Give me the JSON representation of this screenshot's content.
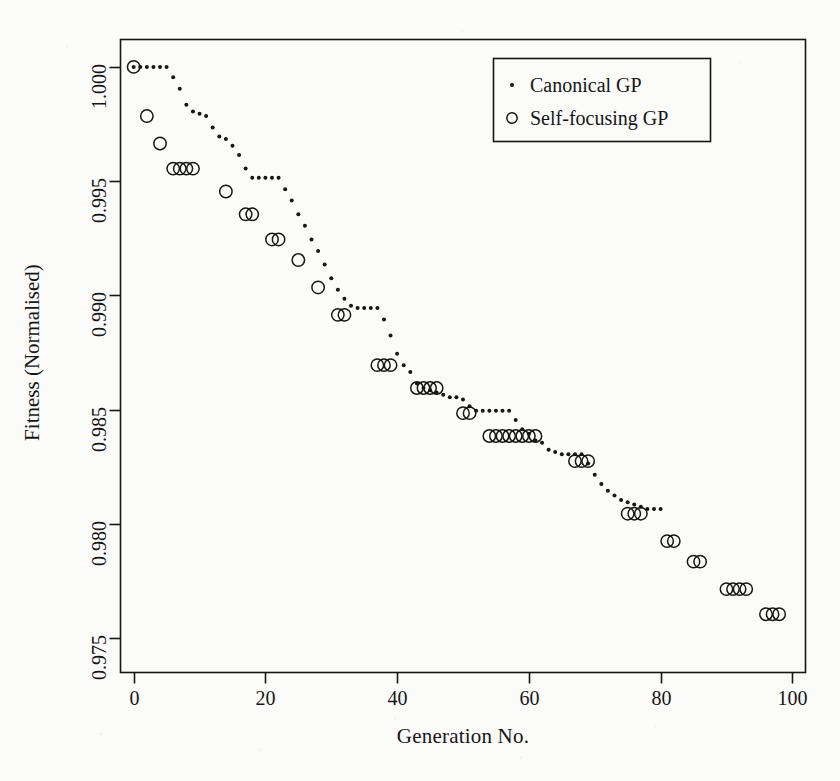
{
  "chart_data": {
    "type": "scatter",
    "title": "",
    "xlabel": "Generation No.",
    "ylabel": "Fitness (Normalised)",
    "xlim": [
      -2,
      102
    ],
    "ylim": [
      0.9735,
      1.0012
    ],
    "xticks": [
      0,
      20,
      40,
      60,
      80,
      100
    ],
    "xticklabels": [
      "0",
      "20",
      "40",
      "60",
      "80",
      "100"
    ],
    "yticks": [
      0.975,
      0.98,
      0.985,
      0.99,
      0.995,
      1.0
    ],
    "yticklabels": [
      "0.975",
      "0.980",
      "0.985",
      "0.990",
      "0.995",
      "1.000"
    ],
    "grid": false,
    "legend_position": "top-right",
    "series": [
      {
        "name": "Canonical GP",
        "marker": "dot",
        "points": [
          [
            0,
            1.0
          ],
          [
            1,
            1.0
          ],
          [
            2,
            1.0
          ],
          [
            3,
            1.0
          ],
          [
            4,
            1.0
          ],
          [
            5,
            1.0
          ],
          [
            6,
            0.99955
          ],
          [
            7,
            0.99905
          ],
          [
            8,
            0.99835
          ],
          [
            9,
            0.99805
          ],
          [
            10,
            0.99795
          ],
          [
            11,
            0.99785
          ],
          [
            12,
            0.99735
          ],
          [
            13,
            0.99695
          ],
          [
            14,
            0.99685
          ],
          [
            15,
            0.99655
          ],
          [
            16,
            0.99615
          ],
          [
            17,
            0.99555
          ],
          [
            18,
            0.99515
          ],
          [
            19,
            0.99515
          ],
          [
            20,
            0.99515
          ],
          [
            21,
            0.99515
          ],
          [
            22,
            0.99515
          ],
          [
            23,
            0.99465
          ],
          [
            24,
            0.99415
          ],
          [
            25,
            0.99355
          ],
          [
            26,
            0.99305
          ],
          [
            27,
            0.99245
          ],
          [
            28,
            0.99195
          ],
          [
            29,
            0.99135
          ],
          [
            30,
            0.99075
          ],
          [
            31,
            0.99025
          ],
          [
            32,
            0.98985
          ],
          [
            33,
            0.98955
          ],
          [
            34,
            0.98945
          ],
          [
            35,
            0.98945
          ],
          [
            36,
            0.98945
          ],
          [
            37,
            0.98945
          ],
          [
            38,
            0.98895
          ],
          [
            39,
            0.98825
          ],
          [
            40,
            0.98745
          ],
          [
            41,
            0.98695
          ],
          [
            42,
            0.98665
          ],
          [
            43,
            0.98615
          ],
          [
            44,
            0.98595
          ],
          [
            45,
            0.98585
          ],
          [
            46,
            0.98575
          ],
          [
            47,
            0.98565
          ],
          [
            48,
            0.98555
          ],
          [
            49,
            0.98555
          ],
          [
            50,
            0.98545
          ],
          [
            51,
            0.98515
          ],
          [
            52,
            0.98495
          ],
          [
            53,
            0.98495
          ],
          [
            54,
            0.98495
          ],
          [
            55,
            0.98495
          ],
          [
            56,
            0.98495
          ],
          [
            57,
            0.98495
          ],
          [
            58,
            0.98455
          ],
          [
            59,
            0.98415
          ],
          [
            60,
            0.98395
          ],
          [
            61,
            0.98365
          ],
          [
            62,
            0.98355
          ],
          [
            63,
            0.98325
          ],
          [
            64,
            0.98315
          ],
          [
            65,
            0.98305
          ],
          [
            66,
            0.98305
          ],
          [
            67,
            0.98305
          ],
          [
            68,
            0.98305
          ],
          [
            69,
            0.98265
          ],
          [
            70,
            0.98215
          ],
          [
            71,
            0.98175
          ],
          [
            72,
            0.98145
          ],
          [
            73,
            0.98125
          ],
          [
            74,
            0.98105
          ],
          [
            75,
            0.98095
          ],
          [
            76,
            0.98085
          ],
          [
            77,
            0.98075
          ],
          [
            78,
            0.98065
          ],
          [
            79,
            0.98065
          ],
          [
            80,
            0.98065
          ]
        ]
      },
      {
        "name": "Self-focusing GP",
        "marker": "circle",
        "points": [
          [
            0,
            1.0
          ],
          [
            2,
            0.99785
          ],
          [
            4,
            0.99665
          ],
          [
            6,
            0.99555
          ],
          [
            7,
            0.99555
          ],
          [
            8,
            0.99555
          ],
          [
            9,
            0.99555
          ],
          [
            14,
            0.99455
          ],
          [
            17,
            0.99355
          ],
          [
            18,
            0.99355
          ],
          [
            21,
            0.99245
          ],
          [
            22,
            0.99245
          ],
          [
            25,
            0.99155
          ],
          [
            28,
            0.99035
          ],
          [
            31,
            0.98915
          ],
          [
            32,
            0.98915
          ],
          [
            37,
            0.98695
          ],
          [
            38,
            0.98695
          ],
          [
            39,
            0.98695
          ],
          [
            43,
            0.98595
          ],
          [
            44,
            0.98595
          ],
          [
            45,
            0.98595
          ],
          [
            46,
            0.98595
          ],
          [
            50,
            0.98485
          ],
          [
            51,
            0.98485
          ],
          [
            54,
            0.98385
          ],
          [
            55,
            0.98385
          ],
          [
            56,
            0.98385
          ],
          [
            57,
            0.98385
          ],
          [
            58,
            0.98385
          ],
          [
            59,
            0.98385
          ],
          [
            60,
            0.98385
          ],
          [
            61,
            0.98385
          ],
          [
            67,
            0.98275
          ],
          [
            68,
            0.98275
          ],
          [
            69,
            0.98275
          ],
          [
            75,
            0.98045
          ],
          [
            76,
            0.98045
          ],
          [
            77,
            0.98045
          ],
          [
            81,
            0.97925
          ],
          [
            82,
            0.97925
          ],
          [
            85,
            0.97835
          ],
          [
            86,
            0.97835
          ],
          [
            90,
            0.97715
          ],
          [
            91,
            0.97715
          ],
          [
            92,
            0.97715
          ],
          [
            93,
            0.97715
          ],
          [
            96,
            0.97605
          ],
          [
            97,
            0.97605
          ],
          [
            98,
            0.97605
          ]
        ]
      }
    ]
  },
  "legend": {
    "entries": [
      {
        "marker": "dot",
        "label": "Canonical GP"
      },
      {
        "marker": "circle",
        "label": "Self-focusing GP"
      }
    ]
  },
  "colors": {
    "ink": "#161616",
    "background": "#fbfbf9"
  }
}
